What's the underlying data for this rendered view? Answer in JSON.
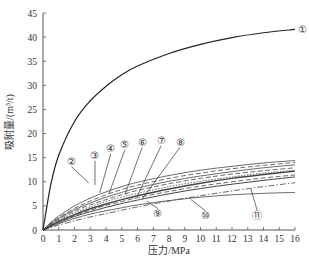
{
  "chart_data": {
    "type": "line",
    "title": "",
    "xlabel": "压力/MPa",
    "ylabel": "吸附量/(m³/t)",
    "xlim": [
      0,
      16
    ],
    "ylim": [
      0,
      45
    ],
    "xticks": [
      0,
      1,
      2,
      3,
      4,
      5,
      6,
      7,
      8,
      9,
      10,
      11,
      12,
      13,
      14,
      15,
      16
    ],
    "yticks": [
      0,
      5,
      10,
      15,
      20,
      25,
      30,
      35,
      40,
      45
    ],
    "grid": false,
    "legend": "inline circled-number labels",
    "x": [
      0,
      0.5,
      1,
      2,
      3,
      4,
      5,
      6,
      8,
      10,
      12,
      14,
      16
    ],
    "series": [
      {
        "name": "①",
        "style": "solid",
        "width": 1.2,
        "values": [
          0,
          9.5,
          15.5,
          22.5,
          26.8,
          29.8,
          32.2,
          34.0,
          36.6,
          38.5,
          39.9,
          40.9,
          41.6
        ]
      },
      {
        "name": "②",
        "style": "solid",
        "width": 0.8,
        "values": [
          0,
          1.6,
          2.9,
          5.0,
          6.6,
          7.9,
          9.0,
          9.9,
          11.3,
          12.4,
          13.2,
          13.9,
          14.4
        ]
      },
      {
        "name": "③",
        "style": "dashed",
        "width": 0.8,
        "values": [
          0,
          1.4,
          2.6,
          4.5,
          6.0,
          7.3,
          8.4,
          9.3,
          10.7,
          11.8,
          12.7,
          13.4,
          14.0
        ]
      },
      {
        "name": "④",
        "style": "solid",
        "width": 0.8,
        "values": [
          0,
          1.3,
          2.4,
          4.2,
          5.6,
          6.8,
          7.8,
          8.7,
          10.1,
          11.2,
          12.1,
          12.9,
          13.5
        ]
      },
      {
        "name": "⑤",
        "style": "dashed",
        "width": 0.8,
        "values": [
          0,
          1.2,
          2.2,
          3.9,
          5.2,
          6.3,
          7.3,
          8.2,
          9.6,
          10.7,
          11.6,
          12.3,
          12.9
        ]
      },
      {
        "name": "⑥",
        "style": "dotted",
        "width": 0.8,
        "values": [
          0,
          1.1,
          2.0,
          3.6,
          4.8,
          5.9,
          6.8,
          7.6,
          9.0,
          10.1,
          11.0,
          11.8,
          12.4
        ]
      },
      {
        "name": "⑦",
        "style": "solid",
        "width": 1.4,
        "values": [
          0,
          0.9,
          1.8,
          3.2,
          4.4,
          5.4,
          6.3,
          7.1,
          8.5,
          9.7,
          10.7,
          11.5,
          12.2
        ]
      },
      {
        "name": "⑧",
        "style": "dashed",
        "width": 0.8,
        "values": [
          0,
          0.9,
          1.7,
          3.0,
          4.1,
          5.1,
          5.9,
          6.7,
          8.0,
          9.1,
          10.0,
          10.8,
          11.4
        ]
      },
      {
        "name": "⑨",
        "style": "solid",
        "width": 1.0,
        "values": [
          0,
          0.8,
          1.5,
          2.8,
          3.8,
          4.7,
          5.5,
          6.2,
          7.5,
          8.6,
          9.5,
          10.3,
          11.0
        ]
      },
      {
        "name": "⑩",
        "style": "solid",
        "width": 0.8,
        "values": [
          0,
          0.7,
          1.3,
          2.4,
          3.3,
          4.0,
          4.6,
          5.2,
          6.1,
          6.8,
          7.3,
          7.6,
          7.8
        ]
      },
      {
        "name": "⑪",
        "style": "dashdot",
        "width": 0.8,
        "values": [
          0,
          0.5,
          1.0,
          1.9,
          2.7,
          3.4,
          4.1,
          4.8,
          6.0,
          7.1,
          8.1,
          9.0,
          9.8
        ]
      }
    ],
    "annotations": [
      {
        "label": "①",
        "x": 16.5,
        "y": 41.6
      },
      {
        "label": "②",
        "x": 1.8,
        "y": 14.2,
        "target_x": 2.9,
        "target_y": 9.8
      },
      {
        "label": "③",
        "x": 3.3,
        "y": 15.4,
        "target_x": 3.3,
        "target_y": 9.3
      },
      {
        "label": "④",
        "x": 4.3,
        "y": 16.8,
        "target_x": 3.6,
        "target_y": 7.7
      },
      {
        "label": "⑤",
        "x": 5.2,
        "y": 17.7,
        "target_x": 4.2,
        "target_y": 7.6
      },
      {
        "label": "⑥",
        "x": 6.3,
        "y": 18.2,
        "target_x": 5.2,
        "target_y": 7.3
      },
      {
        "label": "⑦",
        "x": 7.5,
        "y": 18.5,
        "target_x": 6.0,
        "target_y": 7.1
      },
      {
        "label": "⑧",
        "x": 8.7,
        "y": 18.2,
        "target_x": 6.3,
        "target_y": 6.4
      },
      {
        "label": "⑨",
        "x": 7.3,
        "y": 3.4,
        "target_x": 6.6,
        "target_y": 6.0
      },
      {
        "label": "⑩",
        "x": 10.3,
        "y": 3.0,
        "target_x": 9.4,
        "target_y": 6.3
      },
      {
        "label": "⑪",
        "x": 13.6,
        "y": 3.0,
        "target_x": 13.2,
        "target_y": 8.5
      }
    ]
  },
  "colors": {
    "axis": "#555555",
    "curve_main": "#222222",
    "curve": "#444444"
  }
}
